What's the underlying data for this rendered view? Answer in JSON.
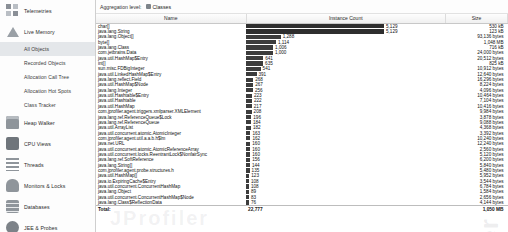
{
  "sidebar": {
    "groups": [
      {
        "label": "Telemetries",
        "icon": "grid-icon",
        "children": []
      },
      {
        "label": "Live Memory",
        "icon": "triangle-icon",
        "children": [
          {
            "label": "All Objects",
            "selected": true
          },
          {
            "label": "Recorded Objects",
            "selected": false
          },
          {
            "label": "Allocation Call Tree",
            "selected": false
          },
          {
            "label": "Allocation Hot Spots",
            "selected": false
          },
          {
            "label": "Class Tracker",
            "selected": false
          }
        ]
      },
      {
        "label": "Heap Walker",
        "icon": "heap-icon",
        "children": []
      },
      {
        "label": "CPU Views",
        "icon": "cpu-icon",
        "children": []
      },
      {
        "label": "Threads",
        "icon": "threads-icon",
        "children": []
      },
      {
        "label": "Monitors & Locks",
        "icon": "lock-icon",
        "children": []
      },
      {
        "label": "Databases",
        "icon": "database-icon",
        "children": []
      },
      {
        "label": "JEE & Probes",
        "icon": "jee-icon",
        "children": []
      },
      {
        "label": "MBeans",
        "icon": "mbean-icon",
        "children": []
      }
    ]
  },
  "toolbar": {
    "aggregation_label": "Aggregation level:",
    "aggregation_value": "Classes",
    "aggregation_icon": "classes-icon"
  },
  "watermark": "JProfiler",
  "table": {
    "columns": [
      "Name",
      "Instance Count",
      "Size"
    ],
    "total_label": "Total:",
    "total_count": "22,777",
    "total_size": "1,050 MB",
    "max_count": 5129,
    "rows": [
      {
        "name": "char[]",
        "count": "5,129",
        "count_n": 5129,
        "size": "530 kB"
      },
      {
        "name": "java.lang.String",
        "count": "5,129",
        "count_n": 5129,
        "size": "123 kB"
      },
      {
        "name": "java.lang.Object[]",
        "count": "1,288",
        "count_n": 1288,
        "size": "93,136 bytes"
      },
      {
        "name": "byte[]",
        "count": "1,114",
        "count_n": 1114,
        "size": "1,048 MB"
      },
      {
        "name": "java.lang.Class",
        "count": "1,006",
        "count_n": 1006,
        "size": "716 kB"
      },
      {
        "name": "com.jetbrains.Data",
        "count": "1,000",
        "count_n": 1000,
        "size": "24,000 bytes"
      },
      {
        "name": "java.util.HashMap$Entry",
        "count": "641",
        "count_n": 641,
        "size": "20,512 bytes"
      },
      {
        "name": "int[]",
        "count": "635",
        "count_n": 635,
        "size": "825 kB"
      },
      {
        "name": "sun.misc.FDBigInteger",
        "count": "541",
        "count_n": 541,
        "size": "10,912 bytes"
      },
      {
        "name": "java.util.LinkedHashMap$Entry",
        "count": "391",
        "count_n": 391,
        "size": "12,640 bytes"
      },
      {
        "name": "java.lang.reflect.Field",
        "count": "268",
        "count_n": 268,
        "size": "16,296 bytes"
      },
      {
        "name": "java.util.HashMap$Node",
        "count": "267",
        "count_n": 267,
        "size": "8,224 bytes"
      },
      {
        "name": "java.lang.Integer",
        "count": "256",
        "count_n": 256,
        "size": "4,096 bytes"
      },
      {
        "name": "java.util.Hashtable$Entry",
        "count": "223",
        "count_n": 223,
        "size": "10,464 bytes"
      },
      {
        "name": "java.util.Hashtable",
        "count": "222",
        "count_n": 222,
        "size": "7,104 bytes"
      },
      {
        "name": "java.util.HashMap",
        "count": "217",
        "count_n": 217,
        "size": "10,416 bytes"
      },
      {
        "name": "com.jprofiler.agent.triggers.xmlparser.XMLElement",
        "count": "208",
        "count_n": 208,
        "size": "9,984 bytes"
      },
      {
        "name": "java.lang.ref.ReferenceQueue$Lock",
        "count": "196",
        "count_n": 196,
        "size": "3,878 bytes"
      },
      {
        "name": "java.lang.ref.ReferenceQueue",
        "count": "184",
        "count_n": 184,
        "size": "9,088 bytes"
      },
      {
        "name": "java.util.ArrayList",
        "count": "182",
        "count_n": 182,
        "size": "4,368 bytes"
      },
      {
        "name": "java.util.concurrent.atomic.AtomicInteger",
        "count": "163",
        "count_n": 163,
        "size": "3,392 bytes"
      },
      {
        "name": "com.jprofiler.agent.util.a.a.b.h$lm",
        "count": "162",
        "count_n": 162,
        "size": "10,240 bytes"
      },
      {
        "name": "java.net.URL",
        "count": "160",
        "count_n": 160,
        "size": "12,240 bytes"
      },
      {
        "name": "java.util.concurrent.atomic.AtomicReferenceArray",
        "count": "160",
        "count_n": 160,
        "size": "2,560 bytes"
      },
      {
        "name": "java.util.concurrent.locks.ReentrantLock$NonfairSync",
        "count": "160",
        "count_n": 160,
        "size": "5,120 bytes"
      },
      {
        "name": "java.lang.ref.SoftReference",
        "count": "156",
        "count_n": 156,
        "size": "6,200 bytes"
      },
      {
        "name": "java.lang.String[]",
        "count": "144",
        "count_n": 144,
        "size": "5,840 bytes"
      },
      {
        "name": "com.jprofiler.agent.probe.structures.h",
        "count": "135",
        "count_n": 135,
        "size": "5,480 bytes"
      },
      {
        "name": "java.util.HashMap[]",
        "count": "123",
        "count_n": 123,
        "size": "5,952 bytes"
      },
      {
        "name": "java.io.ExpiringCache$Entry",
        "count": "108",
        "count_n": 108,
        "size": "3,544 bytes"
      },
      {
        "name": "java.util.concurrent.ConcurrentHashMap",
        "count": "108",
        "count_n": 108,
        "size": "6,784 bytes"
      },
      {
        "name": "java.lang.Object",
        "count": "89",
        "count_n": 89,
        "size": "1,584 bytes"
      },
      {
        "name": "java.util.concurrent.ConcurrentHashMap$Node",
        "count": "83",
        "count_n": 83,
        "size": "2,656 bytes"
      },
      {
        "name": "java.lang.Class$ReflectionData",
        "count": "76",
        "count_n": 76,
        "size": "4,144 bytes"
      }
    ]
  }
}
